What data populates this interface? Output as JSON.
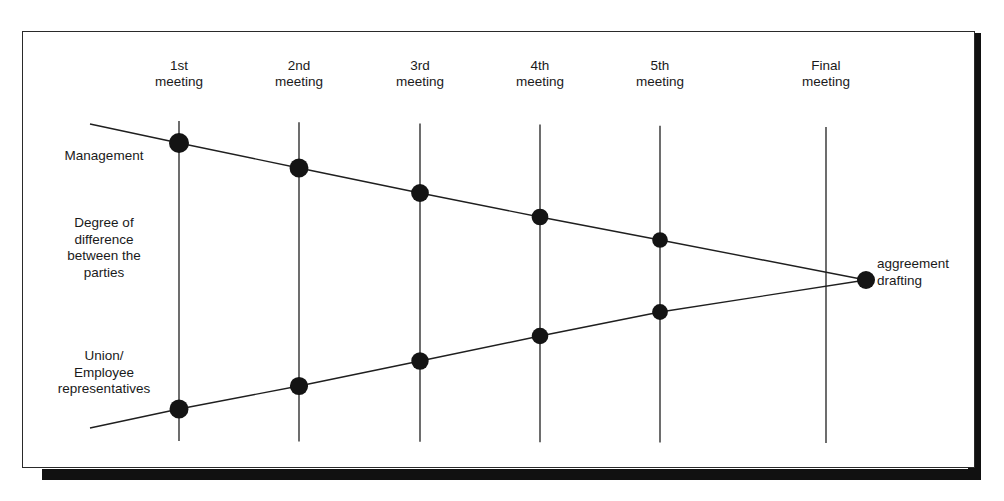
{
  "figure": {
    "kind": "negotiation-convergence-diagram",
    "frame": {
      "x": 22,
      "y": 31,
      "width": 953,
      "height": 437
    },
    "shadow_color": "#111111",
    "line_color": "#1f1f1f",
    "dot_color": "#141414",
    "background": "#ffffff"
  },
  "column_headers": [
    {
      "id": "meeting-1",
      "label": "1st\nmeeting",
      "x": 179
    },
    {
      "id": "meeting-2",
      "label": "2nd\nmeeting",
      "x": 299
    },
    {
      "id": "meeting-3",
      "label": "3rd\nmeeting",
      "x": 420
    },
    {
      "id": "meeting-4",
      "label": "4th\nmeeting",
      "x": 540
    },
    {
      "id": "meeting-5",
      "label": "5th\nmeeting",
      "x": 660
    },
    {
      "id": "meeting-final",
      "label": "Final\nmeeting",
      "x": 826
    }
  ],
  "axis_labels": {
    "top_party": "Management",
    "value_axis": "Degree of\ndifference\nbetween the\nparties",
    "bottom_party": "Union/\nEmployee\nrepresentatives"
  },
  "end_label": "aggreement\ndrafting",
  "chart_data": {
    "type": "line",
    "title": "",
    "xlabel": "",
    "ylabel": "Degree of difference between the parties",
    "categories": [
      "1st meeting",
      "2nd meeting",
      "3rd meeting",
      "4th meeting",
      "5th meeting",
      "Final meeting"
    ],
    "grid": true,
    "legend": "none",
    "x_positions": [
      179,
      299,
      420,
      540,
      660,
      826
    ],
    "convergence_point": {
      "x": 866,
      "y": 280,
      "label": "aggreement drafting"
    },
    "series": [
      {
        "name": "Management",
        "marker": "filled-circle",
        "points": [
          {
            "x": 179,
            "y": 143
          },
          {
            "x": 299,
            "y": 168
          },
          {
            "x": 420,
            "y": 193
          },
          {
            "x": 540,
            "y": 217
          },
          {
            "x": 660,
            "y": 240
          },
          {
            "x": 866,
            "y": 280
          }
        ],
        "line_start": {
          "x": 90,
          "y": 124
        }
      },
      {
        "name": "Union/Employee representatives",
        "marker": "filled-circle",
        "points": [
          {
            "x": 179,
            "y": 409
          },
          {
            "x": 299,
            "y": 386
          },
          {
            "x": 420,
            "y": 361
          },
          {
            "x": 540,
            "y": 336
          },
          {
            "x": 660,
            "y": 312
          },
          {
            "x": 866,
            "y": 280
          }
        ],
        "line_start": {
          "x": 90,
          "y": 428
        }
      }
    ],
    "gridline_top": 121,
    "gridline_bottom": 441
  }
}
